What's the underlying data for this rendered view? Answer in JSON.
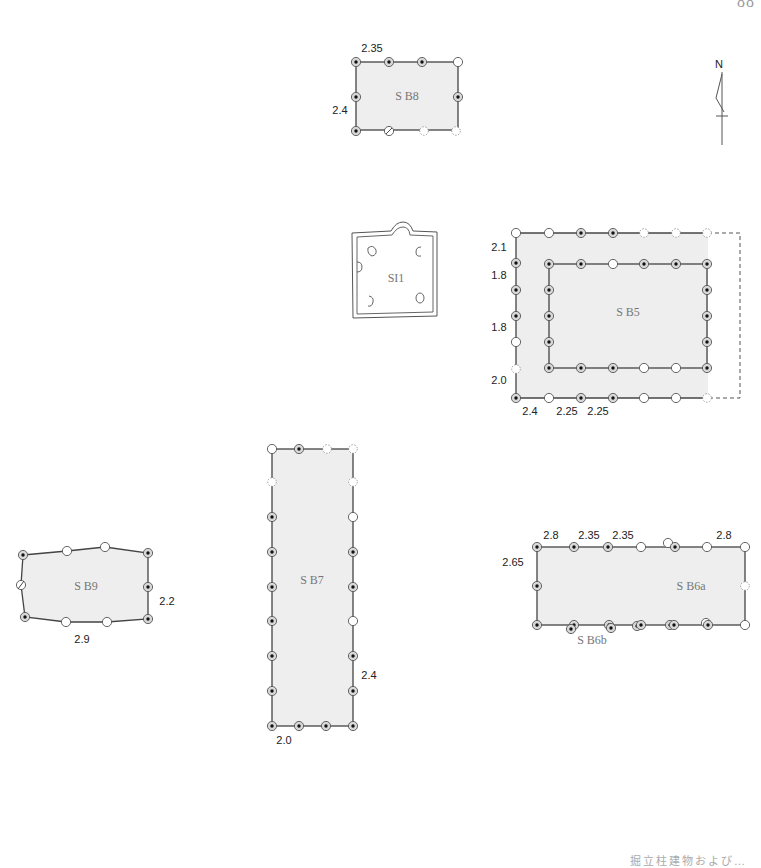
{
  "page": {
    "number": "88",
    "caption": "掘立柱建物および…"
  },
  "north_arrow": {
    "label": "N"
  },
  "structures": {
    "SB8": {
      "label": "S B8",
      "dims": {
        "top": "2.35",
        "left": "2.4"
      }
    },
    "SI1": {
      "label": "SI1"
    },
    "SB5": {
      "label": "S B5",
      "dims": {
        "left_1": "2.1",
        "left_2": "1.8",
        "left_3": "1.8",
        "left_4": "2.0",
        "bottom_1": "2.4",
        "bottom_2": "2.25",
        "bottom_3": "2.25"
      }
    },
    "SB9": {
      "label": "S B9",
      "dims": {
        "right": "2.2",
        "bottom": "2.9"
      }
    },
    "SB7": {
      "label": "S B7",
      "dims": {
        "right": "2.4",
        "bottom": "2.0"
      }
    },
    "SB6a": {
      "label": "S B6a",
      "dims": {
        "top_1": "2.8",
        "top_2": "2.35",
        "top_3": "2.35",
        "top_4": "2.8",
        "left": "2.65"
      }
    },
    "SB6b": {
      "label": "S B6b"
    }
  },
  "legend_types": {
    "ph_with_post": "post-hole with post mark (ringed dot)",
    "ph_open": "post-hole without post mark",
    "ph_presumed": "presumed post-hole (dashed)"
  }
}
